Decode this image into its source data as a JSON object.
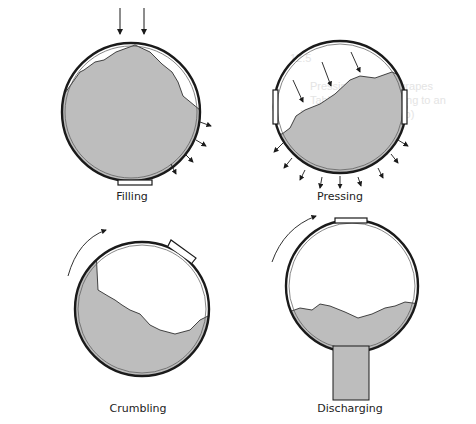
{
  "figure": {
    "fill_color": "#bdbdbd",
    "line_color": "#1a1a1a",
    "panels": [
      {
        "id": "filling",
        "label": "Filling"
      },
      {
        "id": "pressing",
        "label": "Pressing"
      },
      {
        "id": "crumbling",
        "label": "Crumbling"
      },
      {
        "id": "discharging",
        "label": "Discharging"
      }
    ]
  },
  "background_text": {
    "lines": [
      "12.5",
      "Pressing of Scary grapes",
      "Table 12.2b According to an",
      "Program (Figure 12.2b)",
      "Juice (%)",
      "Bumper stop"
    ]
  }
}
